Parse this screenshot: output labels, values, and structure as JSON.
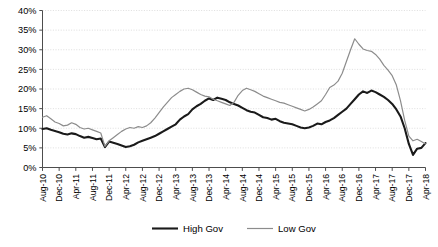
{
  "chart_data": {
    "type": "line",
    "title": "",
    "xlabel": "",
    "ylabel": "",
    "ylim": [
      0,
      40
    ],
    "ytick_values": [
      0,
      5,
      10,
      15,
      20,
      25,
      30,
      35,
      40
    ],
    "ytick_labels": [
      "0%",
      "5%",
      "10%",
      "15%",
      "20%",
      "25%",
      "30%",
      "35%",
      "40%"
    ],
    "grid": true,
    "grid_style": "dotted-horizontal",
    "legend_position": "bottom",
    "x_tick_labels": [
      "Aug-10",
      "Dec-10",
      "Apr-11",
      "Aug-11",
      "Dec-11",
      "Apr-12",
      "Aug-12",
      "Dec-12",
      "Apr-13",
      "Aug-13",
      "Dec-13",
      "Apr-14",
      "Aug-14",
      "Dec-14",
      "Apr-15",
      "Aug-15",
      "Dec-15",
      "Apr-16",
      "Aug-16",
      "Dec-16",
      "Apr-17",
      "Aug-17",
      "Dec-17",
      "Apr-18"
    ],
    "x_tick_interval_months": 4,
    "x_start": "Aug-10",
    "x_end": "Apr-18",
    "categories": [
      "Aug-10",
      "Sep-10",
      "Oct-10",
      "Nov-10",
      "Dec-10",
      "Jan-11",
      "Feb-11",
      "Mar-11",
      "Apr-11",
      "May-11",
      "Jun-11",
      "Jul-11",
      "Aug-11",
      "Sep-11",
      "Oct-11",
      "Nov-11",
      "Dec-11",
      "Jan-12",
      "Feb-12",
      "Mar-12",
      "Apr-12",
      "May-12",
      "Jun-12",
      "Jul-12",
      "Aug-12",
      "Sep-12",
      "Oct-12",
      "Nov-12",
      "Dec-12",
      "Jan-13",
      "Feb-13",
      "Mar-13",
      "Apr-13",
      "May-13",
      "Jun-13",
      "Jul-13",
      "Aug-13",
      "Sep-13",
      "Oct-13",
      "Nov-13",
      "Dec-13",
      "Jan-14",
      "Feb-14",
      "Mar-14",
      "Apr-14",
      "May-14",
      "Jun-14",
      "Jul-14",
      "Aug-14",
      "Sep-14",
      "Oct-14",
      "Nov-14",
      "Dec-14",
      "Jan-15",
      "Feb-15",
      "Mar-15",
      "Apr-15",
      "May-15",
      "Jun-15",
      "Jul-15",
      "Aug-15",
      "Sep-15",
      "Oct-15",
      "Nov-15",
      "Dec-15",
      "Jan-16",
      "Feb-16",
      "Mar-16",
      "Apr-16",
      "May-16",
      "Jun-16",
      "Jul-16",
      "Aug-16",
      "Sep-16",
      "Oct-16",
      "Nov-16",
      "Dec-16",
      "Jan-17",
      "Feb-17",
      "Mar-17",
      "Apr-17",
      "May-17",
      "Jun-17",
      "Jul-17",
      "Aug-17",
      "Sep-17",
      "Oct-17",
      "Nov-17",
      "Dec-17",
      "Jan-18",
      "Feb-18",
      "Mar-18",
      "Apr-18"
    ],
    "series": [
      {
        "name": "High Gov",
        "color": "#1a1a1a",
        "line_width": 2.1,
        "values": [
          9.8,
          10.0,
          9.6,
          9.3,
          9.0,
          8.6,
          8.4,
          8.7,
          8.5,
          8.0,
          7.6,
          7.8,
          7.5,
          7.2,
          7.4,
          5.2,
          6.6,
          6.3,
          6.0,
          5.6,
          5.2,
          5.4,
          5.8,
          6.4,
          6.8,
          7.2,
          7.6,
          8.0,
          8.6,
          9.2,
          9.8,
          10.4,
          11.0,
          12.2,
          13.0,
          13.6,
          14.8,
          15.6,
          16.2,
          17.0,
          17.6,
          17.2,
          17.8,
          17.5,
          17.2,
          16.6,
          16.2,
          15.8,
          15.2,
          14.6,
          14.2,
          14.0,
          13.4,
          12.8,
          12.6,
          12.2,
          12.4,
          11.8,
          11.4,
          11.2,
          11.0,
          10.6,
          10.2,
          10.0,
          10.2,
          10.6,
          11.2,
          11.0,
          11.6,
          12.0,
          12.6,
          13.4,
          14.2,
          15.0,
          16.2,
          17.4,
          18.6,
          19.4,
          19.0,
          19.6,
          19.2,
          18.6,
          18.0,
          17.2,
          16.2,
          14.8,
          13.0,
          10.0,
          6.0,
          3.2,
          4.8,
          5.0,
          6.2
        ]
      },
      {
        "name": "Low Gov",
        "color": "#8c8c8c",
        "line_width": 1.2,
        "values": [
          12.8,
          13.2,
          12.4,
          11.6,
          11.2,
          10.6,
          10.8,
          11.4,
          11.0,
          10.2,
          9.8,
          10.0,
          9.6,
          9.2,
          8.8,
          5.4,
          6.8,
          7.6,
          8.4,
          9.2,
          9.8,
          10.2,
          10.0,
          10.4,
          10.2,
          10.6,
          11.4,
          12.6,
          14.0,
          15.4,
          16.6,
          17.8,
          18.6,
          19.4,
          20.0,
          20.2,
          19.8,
          19.2,
          18.6,
          18.2,
          18.0,
          17.4,
          17.0,
          16.6,
          16.2,
          15.8,
          16.6,
          18.4,
          19.6,
          20.2,
          19.8,
          19.4,
          18.8,
          18.2,
          17.8,
          17.4,
          17.0,
          16.6,
          16.4,
          16.0,
          15.6,
          15.2,
          14.8,
          14.4,
          14.8,
          15.4,
          16.2,
          17.0,
          18.6,
          20.4,
          21.0,
          22.0,
          24.0,
          27.0,
          30.0,
          32.8,
          31.4,
          30.2,
          29.8,
          29.6,
          28.8,
          27.6,
          26.0,
          24.8,
          23.4,
          21.0,
          17.0,
          12.0,
          8.0,
          6.8,
          7.2,
          6.6,
          6.0
        ]
      }
    ],
    "legend": [
      {
        "label": "High Gov",
        "color": "#1a1a1a",
        "line_width": 2.1
      },
      {
        "label": "Low Gov",
        "color": "#8c8c8c",
        "line_width": 1.2
      }
    ]
  }
}
